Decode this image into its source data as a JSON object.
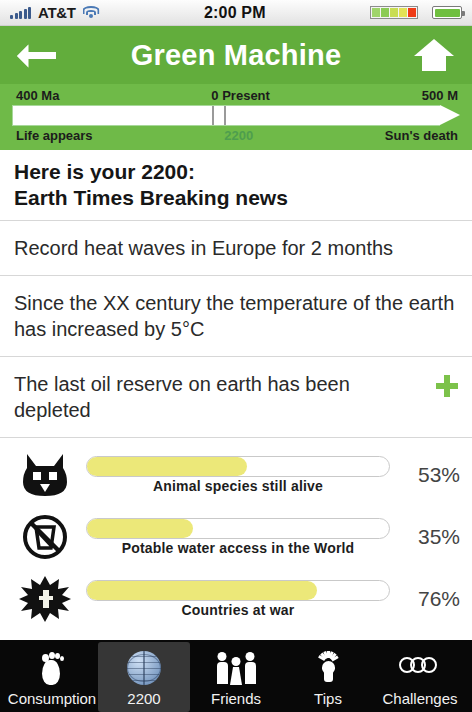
{
  "statusbar": {
    "carrier": "AT&T",
    "time": "2:00 PM",
    "signal_icon": "signal-bars-icon",
    "wifi_icon": "wifi-icon",
    "battery_icon": "battery-icon",
    "meter_colors": [
      "#9fd46a",
      "#8ccb55",
      "#c9dd52",
      "#e3e356",
      "#ef3b17"
    ]
  },
  "navbar": {
    "title": "Green Machine",
    "back_icon": "back-arrow-icon",
    "home_icon": "home-icon",
    "green": "#62ad3c"
  },
  "timeline": {
    "left_top": "400 Ma",
    "mid_top": "0 Present",
    "right_top": "500 M",
    "left_bottom": "Life appears",
    "mid_bottom": "2200",
    "right_bottom": "Sun's death",
    "tick_positions_pct": [
      46.5,
      49.5
    ],
    "track_color": "#ffffff",
    "background": "#6fba48"
  },
  "headline": {
    "line1": "Here is your 2200:",
    "line2": "Earth Times Breaking news"
  },
  "news": [
    {
      "text": "Record heat waves in Europe for 2 months",
      "has_plus": false
    },
    {
      "text": "Since the XX century the temperature of the earth has increased by 5°C",
      "has_plus": false
    },
    {
      "text": "The last oil reserve on earth has been depleted",
      "has_plus": true
    }
  ],
  "stats": [
    {
      "icon": "animal-face-icon",
      "caption": "Animal species still alive",
      "percent": 53,
      "percent_label": "53%"
    },
    {
      "icon": "no-potable-water-icon",
      "caption": "Potable water access in the World",
      "percent": 35,
      "percent_label": "35%"
    },
    {
      "icon": "explosion-icon",
      "caption": "Countries at war",
      "percent": 76,
      "percent_label": "76%"
    }
  ],
  "bar_fill_color": "#ece879",
  "tabs": [
    {
      "label": "Consumption",
      "icon": "footprint-icon",
      "active": false
    },
    {
      "label": "2200",
      "icon": "globe-icon",
      "active": true
    },
    {
      "label": "Friends",
      "icon": "people-icon",
      "active": false
    },
    {
      "label": "Tips",
      "icon": "lightbulb-icon",
      "active": false
    },
    {
      "label": "Challenges",
      "icon": "olympic-rings-icon",
      "active": false
    }
  ]
}
